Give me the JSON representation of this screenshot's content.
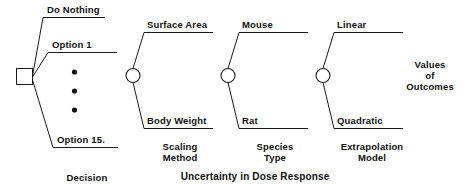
{
  "diagram": {
    "title_bottom_center": "Uncertainty in Dose Response",
    "decision_node": {
      "type": "decision-square",
      "label": "Decision",
      "branches": [
        {
          "label": "Do Nothing"
        },
        {
          "label": "Option 1"
        },
        {
          "label": "Option 15."
        }
      ],
      "ellipsis_dots": 3
    },
    "chance_nodes": [
      {
        "id": "scaling-method",
        "type": "chance-circle",
        "stage_label_line1": "Scaling",
        "stage_label_line2": "Method",
        "branch_top": "Surface Area",
        "branch_bottom": "Body Weight"
      },
      {
        "id": "species-type",
        "type": "chance-circle",
        "stage_label_line1": "Species",
        "stage_label_line2": "Type",
        "branch_top": "Mouse",
        "branch_bottom": "Rat"
      },
      {
        "id": "extrapolation-model",
        "type": "chance-circle",
        "stage_label_line1": "Extrapolation",
        "stage_label_line2": "Model",
        "branch_top": "Linear",
        "branch_bottom": "Quadratic"
      }
    ],
    "outcome": {
      "line1": "Values",
      "line2": "of",
      "line3": "Outcomes"
    },
    "colors": {
      "ink": "#111111",
      "line": "#1a1a1a",
      "background": "#ffffff"
    }
  }
}
